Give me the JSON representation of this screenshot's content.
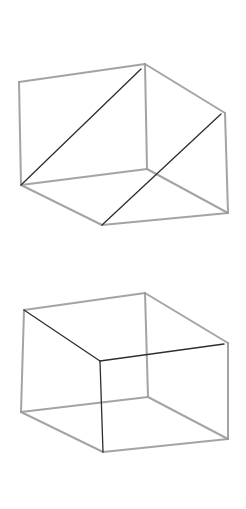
{
  "canvas": {
    "width": 246,
    "height": 509,
    "background": "#ffffff"
  },
  "colors": {
    "light_edge": "#9a9a9a",
    "dark_edge": "#2e2e2e"
  },
  "figures": [
    {
      "name": "cube-top",
      "description": "Hand-sketched cube with two parallel dark diagonals",
      "vertices": {
        "top_left": [
          19,
          82
        ],
        "top_back": [
          145,
          64
        ],
        "top_right": [
          225,
          113
        ],
        "bottom_left": [
          21,
          185
        ],
        "bottom_back": [
          147,
          169
        ],
        "bottom_front": [
          102,
          225
        ],
        "bottom_right": [
          228,
          213
        ]
      },
      "light_edges": [
        [
          "top_left",
          "top_back"
        ],
        [
          "top_back",
          "top_right"
        ],
        [
          "top_left",
          "bottom_left"
        ],
        [
          "top_back",
          "bottom_back"
        ],
        [
          "top_right",
          "bottom_right"
        ],
        [
          "bottom_left",
          "bottom_back"
        ],
        [
          "bottom_back",
          "bottom_right"
        ],
        [
          "bottom_left",
          "bottom_front"
        ],
        [
          "bottom_front",
          "bottom_right"
        ]
      ],
      "dark_edges": [
        [
          [
            141,
            69
          ],
          [
            21,
            185
          ]
        ],
        [
          [
            221,
            114
          ],
          [
            102,
            225
          ]
        ]
      ]
    },
    {
      "name": "cube-bottom",
      "description": "Hand-sketched cube with dark front-corner edges",
      "vertices": {
        "top_left": [
          24,
          310
        ],
        "top_back": [
          145,
          293
        ],
        "top_right": [
          228,
          343
        ],
        "front_top": [
          100,
          361
        ],
        "bottom_left": [
          21,
          412
        ],
        "bottom_back": [
          148,
          397
        ],
        "bottom_front": [
          103,
          452
        ],
        "bottom_right": [
          228,
          439
        ]
      },
      "light_edges": [
        [
          "top_left",
          "top_back"
        ],
        [
          "top_back",
          "top_right"
        ],
        [
          "top_left",
          "bottom_left"
        ],
        [
          "top_back",
          "bottom_back"
        ],
        [
          "top_right",
          "bottom_right"
        ],
        [
          "bottom_left",
          "bottom_back"
        ],
        [
          "bottom_back",
          "bottom_right"
        ],
        [
          "bottom_left",
          "bottom_front"
        ],
        [
          "bottom_front",
          "bottom_right"
        ]
      ],
      "dark_edges": [
        [
          [
            24,
            310
          ],
          [
            100,
            361
          ]
        ],
        [
          [
            100,
            361
          ],
          [
            224,
            344
          ]
        ],
        [
          [
            100,
            361
          ],
          [
            103,
            452
          ]
        ]
      ]
    }
  ]
}
